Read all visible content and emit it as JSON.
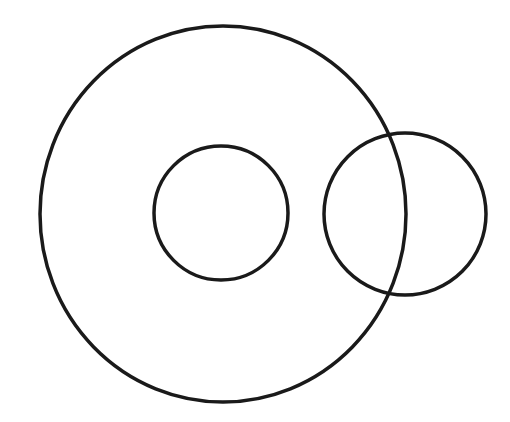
{
  "diagram": {
    "background": "#ffffff",
    "stroke_color": "#1a1a1a",
    "stroke_width": 3.5,
    "shapes": [
      {
        "name": "outer-circle",
        "type": "ellipse",
        "cx": 223,
        "cy": 214,
        "rx": 183,
        "ry": 188
      },
      {
        "name": "inner-circle",
        "type": "circle",
        "cx": 221,
        "cy": 213,
        "r": 67
      },
      {
        "name": "right-circle",
        "type": "circle",
        "cx": 405,
        "cy": 214,
        "r": 81
      }
    ]
  }
}
